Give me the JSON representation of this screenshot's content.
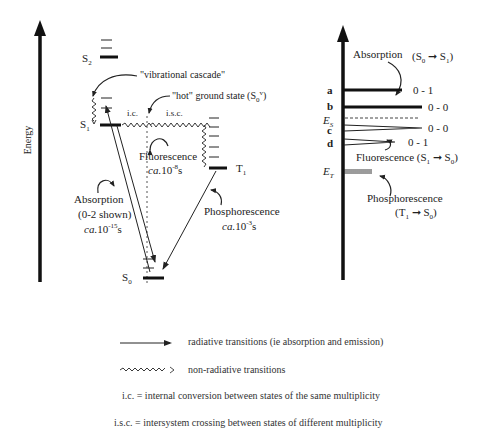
{
  "axis": {
    "label": "Energy"
  },
  "jablonski": {
    "states": {
      "s2": "S",
      "s2_sub": "2",
      "s1": "S",
      "s1_sub": "1",
      "t1": "T",
      "t1_sub": "1",
      "s0": "S",
      "s0_sub": "0"
    },
    "labels": {
      "vibrational_cascade": "\"vibrational cascade\"",
      "hot_ground_state": "\"hot\" ground state (S",
      "hot_ground_state_sub": "0",
      "hot_ground_state_sup": "v",
      "hot_ground_state_end": ")",
      "ic": "i.c.",
      "isc": "i.s.c.",
      "fluorescence": "Fluorescence",
      "fluorescence_time_prefix": "ca.",
      "fluorescence_time": "10",
      "fluorescence_time_exp": "-8",
      "fluorescence_time_unit": "s",
      "absorption": "Absorption",
      "absorption_note": "(0-2 shown)",
      "absorption_time_prefix": "ca.",
      "absorption_time": "10",
      "absorption_time_exp": "-15",
      "absorption_time_unit": "s",
      "phosphorescence": "Phosphorescence",
      "phosphorescence_time_prefix": "ca.",
      "phosphorescence_time": "10",
      "phosphorescence_time_exp": "-3",
      "phosphorescence_time_unit": "s"
    }
  },
  "spectrum": {
    "absorption_label": "Absorption",
    "absorption_transition": "(S",
    "absorption_from_sub": "0",
    "absorption_to": "S",
    "absorption_to_sub": "1",
    "close_paren": ")",
    "lines": [
      {
        "letter": "a",
        "band": "0 - 1"
      },
      {
        "letter": "b",
        "band": "0 - 0"
      },
      {
        "letter": "c",
        "band": "0 - 0"
      },
      {
        "letter": "d",
        "band": "0 - 1"
      }
    ],
    "es_label": "E",
    "es_sub": "S",
    "et_label": "E",
    "et_sub": "T",
    "fluorescence_label": "Fluorescence (S",
    "fluorescence_from_sub": "1",
    "fluorescence_to": "S",
    "fluorescence_to_sub": "0",
    "phosphorescence_label": "Phosphorescence",
    "phosphorescence_transition": "(T",
    "phosphorescence_from_sub": "1",
    "phosphorescence_to": "S",
    "phosphorescence_to_sub": "0"
  },
  "legend": {
    "radiative": "radiative transitions (ie absorption and emission)",
    "nonradiative": "non-radiative transitions",
    "ic": "i.c.  =  internal conversion between states of the same multiplicity",
    "isc": "i.s.c.  = intersystem crossing between states of different multiplicity"
  }
}
